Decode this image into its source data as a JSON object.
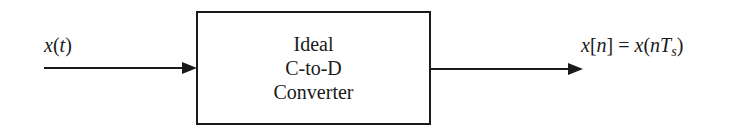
{
  "diagram": {
    "type": "block-diagram",
    "input": {
      "label_var": "x",
      "label_open": "(",
      "label_arg": "t",
      "label_close": ")"
    },
    "block": {
      "lines": [
        "Ideal",
        "C-to-D",
        "Converter"
      ]
    },
    "output": {
      "lhs_var": "x",
      "lhs_open": "[",
      "lhs_arg": "n",
      "lhs_close": "]",
      "equals": " = ",
      "rhs_var": "x",
      "rhs_open": "(",
      "rhs_arg": "nT",
      "rhs_sub": "s",
      "rhs_close": ")"
    },
    "colors": {
      "stroke": "#1a1a1a",
      "background": "#ffffff"
    }
  }
}
